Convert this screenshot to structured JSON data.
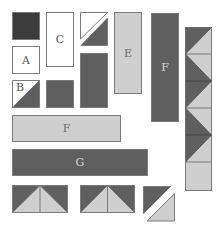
{
  "colors": {
    "white": "#ffffff",
    "light": "#cfcfcf",
    "dark": "#5f5f5f",
    "darkest": "#3c3c3c",
    "outline": "#7a7a7a"
  },
  "pieces": {
    "dark_square": {
      "label": ""
    },
    "A": {
      "label": "A"
    },
    "B": {
      "label": "B"
    },
    "C": {
      "label": "C"
    },
    "E": {
      "label": "E"
    },
    "F_vertical": {
      "label": "F"
    },
    "F_horizontal": {
      "label": "F"
    },
    "G": {
      "label": "G"
    }
  },
  "zigzag_column": {
    "squares": 6
  },
  "flying_geese": {
    "units": 2
  }
}
